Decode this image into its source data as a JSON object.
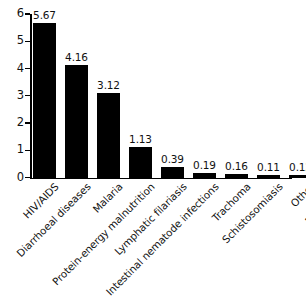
{
  "chart_data": {
    "type": "bar",
    "title": "",
    "subtitle": "",
    "xlabel": "",
    "ylabel": "",
    "ylim": [
      0,
      6
    ],
    "yticks": [
      0,
      1,
      2,
      3,
      4,
      5,
      6
    ],
    "ytick_labels": [
      "0",
      "1",
      "2",
      "3",
      "4",
      "5",
      "6"
    ],
    "grid": false,
    "legend": null,
    "bar_color": "#000000",
    "background_color": "#ffffff",
    "categories": [
      "HIV/AIDS",
      "Diarrhoeal diseases",
      "Malaria",
      "Protein-energy malnutrition",
      "Lymphatic filariasis",
      "Intestinal nematode infections",
      "Trachoma",
      "Schistosomiasis",
      "Other",
      "Drownings"
    ],
    "values": [
      5.67,
      4.16,
      3.12,
      1.13,
      0.39,
      0.19,
      0.16,
      0.11,
      0.12,
      0.73
    ],
    "value_labels": [
      "5.67",
      "4.16",
      "3.12",
      "1.13",
      "0.39",
      "0.19",
      "0.16",
      "0.11",
      "0.12",
      "0.73"
    ],
    "x_label_rotation_deg": -45
  }
}
